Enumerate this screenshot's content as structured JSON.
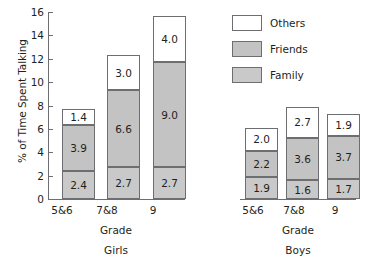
{
  "chart_data": {
    "type": "bar",
    "title": "",
    "subtitle": "",
    "xlabel": "Grade",
    "ylabel": "% of Time Spent Talking",
    "ylim": [
      0,
      16
    ],
    "ytick_values": [
      16,
      14,
      12,
      10,
      8,
      6,
      4,
      2,
      0
    ],
    "ytick_labels": [
      "16",
      "14",
      "12",
      "10",
      "8",
      "6",
      "4",
      "2",
      "0"
    ],
    "grid": false,
    "stacked": true,
    "legend_position": "top-right",
    "legend": [
      "Others",
      "Friends",
      "Family"
    ],
    "series_order_bottom_to_top": [
      "Family",
      "Friends",
      "Others"
    ],
    "panels": [
      {
        "name": "Girls",
        "caption": "Girls",
        "xlabel": "Grade",
        "categories": [
          "5&6",
          "7&8",
          "9"
        ],
        "series": [
          {
            "name": "Family",
            "values": [
              2.4,
              2.7,
              2.7
            ]
          },
          {
            "name": "Friends",
            "values": [
              3.9,
              6.6,
              9.0
            ]
          },
          {
            "name": "Others",
            "values": [
              1.4,
              3.0,
              4.0
            ]
          }
        ],
        "totals": [
          7.7,
          12.3,
          15.7
        ]
      },
      {
        "name": "Boys",
        "caption": "Boys",
        "xlabel": "Grade",
        "categories": [
          "5&6",
          "7&8",
          "9"
        ],
        "series": [
          {
            "name": "Family",
            "values": [
              1.9,
              1.6,
              1.7
            ]
          },
          {
            "name": "Friends",
            "values": [
              2.2,
              3.6,
              3.7
            ]
          },
          {
            "name": "Others",
            "values": [
              2.0,
              2.7,
              1.9
            ]
          }
        ],
        "totals": [
          6.1,
          7.9,
          7.3
        ]
      }
    ],
    "colors": {
      "others": "#ffffff",
      "friends": "#c3c3c3",
      "family": "#c9c9c9",
      "outline": "#6d6e71",
      "text": "#231f20"
    },
    "value_labels": {
      "girls": {
        "5&6": {
          "family": "2.4",
          "friends": "3.9",
          "others": "1.4"
        },
        "7&8": {
          "family": "2.7",
          "friends": "6.6",
          "others": "3.0"
        },
        "9": {
          "family": "2.7",
          "friends": "9.0",
          "others": "4.0"
        }
      },
      "boys": {
        "5&6": {
          "family": "1.9",
          "friends": "2.2",
          "others": "2.0"
        },
        "7&8": {
          "family": "1.6",
          "friends": "3.6",
          "others": "2.7"
        },
        "9": {
          "family": "1.7",
          "friends": "3.7",
          "others": "1.9"
        }
      }
    }
  }
}
